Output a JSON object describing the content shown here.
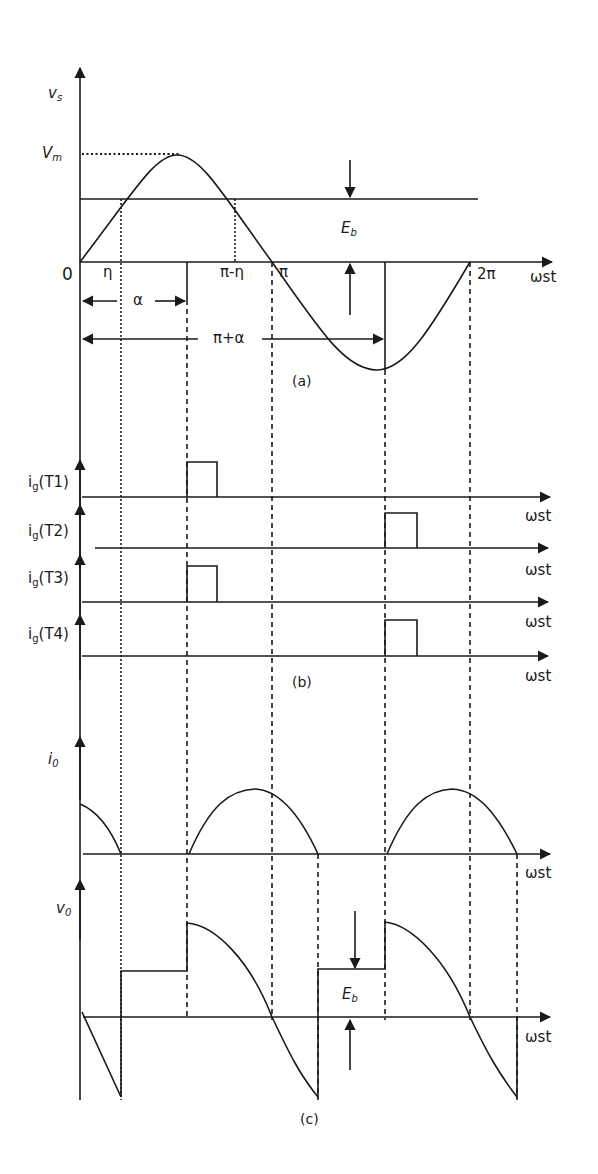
{
  "figure": {
    "panel_a": {
      "caption": "(a)",
      "y_axis_label": "v",
      "y_axis_sub": "s",
      "vm_label": "V",
      "vm_sub": "m",
      "origin_label": "0",
      "x_ticks": [
        "η",
        "π-η",
        "π",
        "2π"
      ],
      "alpha_label": "α",
      "pi_alpha_label": "π+α",
      "eb_label": "E",
      "eb_sub": "b",
      "x_axis_label": "ωst"
    },
    "panel_b": {
      "caption": "(b)",
      "traces": [
        {
          "label": "i",
          "sub": "g",
          "device": "(T1)",
          "pulse_at": "α"
        },
        {
          "label": "i",
          "sub": "g",
          "device": "(T2)",
          "pulse_at": "π+α"
        },
        {
          "label": "i",
          "sub": "g",
          "device": "(T3)",
          "pulse_at": "α"
        },
        {
          "label": "i",
          "sub": "g",
          "device": "(T4)",
          "pulse_at": "π+α"
        }
      ],
      "x_axis_label": "ωst"
    },
    "panel_c": {
      "caption": "(c)",
      "io_label": "i",
      "io_sub": "0",
      "vo_label": "v",
      "vo_sub": "0",
      "eb_label": "E",
      "eb_sub": "b",
      "x_axis_label": "ωst"
    },
    "colors": {
      "line": "#1a1a1a",
      "background": "#ffffff"
    }
  }
}
